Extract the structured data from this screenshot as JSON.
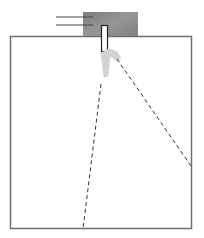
{
  "diagram": {
    "colors": {
      "background": "#ffffff",
      "box_border": "#6e6e6e",
      "device_block": "#8a8a8a",
      "device_block_edge": "#7a7a7a",
      "tube_fill": "#ffffff",
      "tube_stroke": "#222222",
      "clip_fill": "#d2d2d2",
      "wire": "#444444",
      "dashed_line": "#333333"
    },
    "box": {
      "x": 10,
      "y": 36,
      "width": 182,
      "height": 193
    },
    "device_block": {
      "x": 83,
      "y": 12,
      "width": 55,
      "height": 24
    },
    "wires": [
      {
        "x1": 56,
        "y1": 17,
        "x2": 93,
        "y2": 17
      },
      {
        "x1": 56,
        "y1": 25,
        "x2": 93,
        "y2": 25
      }
    ],
    "tube": {
      "x": 101,
      "y": 25,
      "width": 7,
      "height": 26
    },
    "dashed_lines": [
      {
        "name": "left-beam",
        "x1": 101,
        "y1": 84,
        "x2": 83,
        "y2": 229
      },
      {
        "name": "right-beam",
        "x1": 117,
        "y1": 59,
        "x2": 191,
        "y2": 166
      }
    ]
  }
}
